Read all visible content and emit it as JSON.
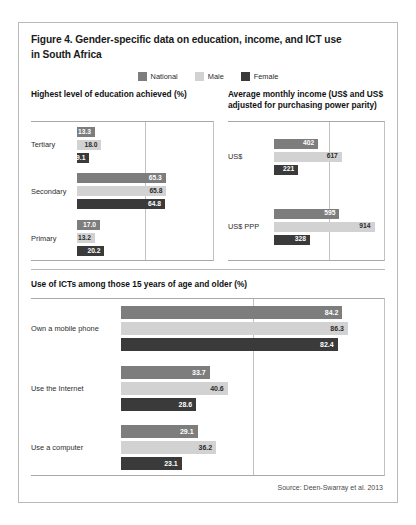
{
  "figure": {
    "title_line1": "Figure 4. Gender-specific data on education, income, and ICT use",
    "title_line2": "in South Africa",
    "source": "Source: Deen-Swarray et al. 2013"
  },
  "legend": {
    "items": [
      {
        "label": "National",
        "color": "#7d7d7d"
      },
      {
        "label": "Male",
        "color": "#d2d2d2"
      },
      {
        "label": "Female",
        "color": "#3a3a3a"
      }
    ]
  },
  "panels": {
    "education": {
      "heading": "Highest level of education achieved (%)"
    },
    "income": {
      "heading_line1": "Average monthly income (US$ and US$",
      "heading_line2": "adjusted for purchasing power parity)"
    },
    "ict": {
      "heading": "Use of ICTs among those 15 years of age and older (%)"
    }
  },
  "chart_data": [
    {
      "type": "bar",
      "title": "Highest level of education achieved (%)",
      "orientation": "horizontal",
      "categories": [
        "Tertiary",
        "Secondary",
        "Primary"
      ],
      "series": [
        {
          "name": "National",
          "color": "#7d7d7d",
          "values": [
            13.3,
            65.3,
            17.0
          ]
        },
        {
          "name": "Male",
          "color": "#d2d2d2",
          "values": [
            18.0,
            65.8,
            13.2
          ]
        },
        {
          "name": "Female",
          "color": "#3a3a3a",
          "values": [
            9.1,
            64.8,
            20.2
          ]
        }
      ],
      "labels": {
        "Tertiary": [
          "13.3",
          "18.0",
          "9.1"
        ],
        "Secondary": [
          "65.3",
          "65.8",
          "64.8"
        ],
        "Primary": [
          "17.0",
          "13.2",
          "20.2"
        ]
      },
      "xlabel": "",
      "ylabel": "",
      "xlim": [
        0,
        100
      ],
      "gridlines": [
        50,
        100
      ],
      "grid": true,
      "legend_position": "top-center"
    },
    {
      "type": "bar",
      "title": "Average monthly income (US$ and US$ adjusted for purchasing power parity)",
      "orientation": "horizontal",
      "categories": [
        "US$",
        "US$ PPP"
      ],
      "series": [
        {
          "name": "National",
          "color": "#7d7d7d",
          "values": [
            402,
            595
          ]
        },
        {
          "name": "Male",
          "color": "#d2d2d2",
          "values": [
            617,
            914
          ]
        },
        {
          "name": "Female",
          "color": "#3a3a3a",
          "values": [
            221,
            328
          ]
        }
      ],
      "labels": {
        "US$": [
          "402",
          "617",
          "221"
        ],
        "US$ PPP": [
          "595",
          "914",
          "328"
        ]
      },
      "xlabel": "",
      "ylabel": "",
      "xlim": [
        0,
        1000
      ],
      "gridlines": [
        500,
        1000
      ],
      "grid": true,
      "legend_position": "top-center"
    },
    {
      "type": "bar",
      "title": "Use of ICTs among those 15 years of age and older (%)",
      "orientation": "horizontal",
      "categories": [
        "Own a mobile phone",
        "Use the Internet",
        "Use a computer"
      ],
      "series": [
        {
          "name": "National",
          "color": "#7d7d7d",
          "values": [
            84.2,
            33.7,
            29.1
          ]
        },
        {
          "name": "Male",
          "color": "#d2d2d2",
          "values": [
            86.3,
            40.6,
            36.2
          ]
        },
        {
          "name": "Female",
          "color": "#3a3a3a",
          "values": [
            82.4,
            28.6,
            23.1
          ]
        }
      ],
      "labels": {
        "Own a mobile phone": [
          "84.2",
          "86.3",
          "82.4"
        ],
        "Use the Internet": [
          "33.7",
          "40.6",
          "28.6"
        ],
        "Use a computer": [
          "29.1",
          "36.2",
          "23.1"
        ]
      },
      "xlabel": "",
      "ylabel": "",
      "xlim": [
        0,
        100
      ],
      "gridlines": [
        50,
        100
      ],
      "grid": true,
      "legend_position": "top-center"
    }
  ]
}
